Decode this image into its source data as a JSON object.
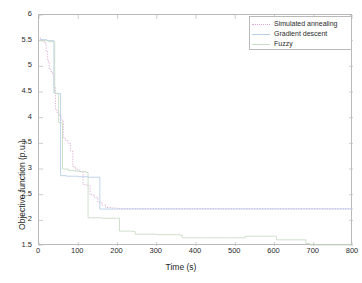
{
  "chart_data": {
    "type": "line",
    "title": "",
    "xlabel": "Time (s)",
    "ylabel": "Objective function (p.u.)",
    "xlim": [
      0,
      800
    ],
    "ylim": [
      1.5,
      6
    ],
    "xticks": [
      0,
      100,
      200,
      300,
      400,
      500,
      600,
      700,
      800
    ],
    "yticks": [
      1.5,
      2,
      2.5,
      3,
      3.5,
      4,
      4.5,
      5,
      5.5,
      6
    ],
    "xtick_labels": [
      "0",
      "100",
      "200",
      "300",
      "400",
      "500",
      "600",
      "700",
      "800"
    ],
    "ytick_labels": [
      "1.5",
      "2",
      "2.5",
      "3",
      "3.5",
      "4",
      "4.5",
      "5",
      "5.5",
      "6"
    ],
    "grid": false,
    "legend_position": "top-right",
    "step_style": "post",
    "series": [
      {
        "name": "Simulated annealing",
        "color": "#d9a7d2",
        "style": "dotted",
        "x": [
          2,
          6,
          10,
          14,
          18,
          22,
          26,
          30,
          34,
          38,
          42,
          46,
          50,
          56,
          62,
          68,
          74,
          80,
          86,
          92,
          98,
          104,
          112,
          120,
          130,
          140,
          150,
          160,
          170,
          185,
          200,
          800
        ],
        "y": [
          5.55,
          5.52,
          5.48,
          5.45,
          5.3,
          5.1,
          4.95,
          4.9,
          4.85,
          4.6,
          4.15,
          4.1,
          4.05,
          3.95,
          3.6,
          3.55,
          3.5,
          3.35,
          3.05,
          3.0,
          2.98,
          2.95,
          2.7,
          2.68,
          2.5,
          2.45,
          2.35,
          2.3,
          2.25,
          2.24,
          2.23,
          2.23
        ]
      },
      {
        "name": "Gradient descent",
        "color": "#b9cfe8",
        "style": "solid",
        "x": [
          2,
          20,
          38,
          45,
          55,
          70,
          85,
          100,
          115,
          125,
          155,
          200,
          800
        ],
        "y": [
          5.52,
          5.5,
          4.48,
          4.47,
          2.87,
          2.86,
          2.86,
          2.85,
          2.85,
          2.84,
          2.22,
          2.22,
          2.22
        ]
      },
      {
        "name": "Fuzzy",
        "color": "#c9dcc6",
        "style": "solid",
        "x": [
          2,
          25,
          40,
          50,
          60,
          75,
          90,
          100,
          120,
          125,
          160,
          200,
          205,
          240,
          245,
          300,
          360,
          365,
          420,
          480,
          520,
          525,
          560,
          600,
          605,
          670,
          680,
          690,
          800
        ],
        "y": [
          5.5,
          5.48,
          4.47,
          3.9,
          3.0,
          2.97,
          2.96,
          2.95,
          2.93,
          2.05,
          2.04,
          2.04,
          1.79,
          1.78,
          1.73,
          1.72,
          1.71,
          1.66,
          1.66,
          1.66,
          1.66,
          1.69,
          1.69,
          1.69,
          1.62,
          1.62,
          1.55,
          1.52,
          1.52
        ]
      }
    ]
  },
  "legend": {
    "items": [
      {
        "label": "Simulated annealing"
      },
      {
        "label": "Gradient descent"
      },
      {
        "label": "Fuzzy"
      }
    ]
  },
  "axes": {
    "xlabel": "Time (s)",
    "ylabel": "Objective function (p.u.)"
  },
  "colors": {
    "frame": "#b9b9b9",
    "text": "#2b2b2b",
    "background": "#ffffff"
  }
}
